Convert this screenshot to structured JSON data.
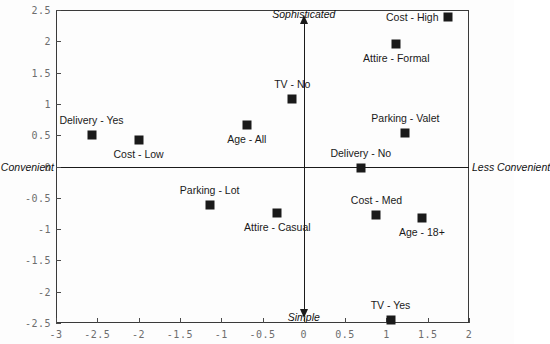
{
  "chart_data": {
    "type": "scatter",
    "title": "",
    "subtitle": "",
    "xlabel": "",
    "ylabel": "",
    "xlim": [
      -3,
      2
    ],
    "ylim": [
      -2.5,
      2.5
    ],
    "grid": false,
    "legend": "none",
    "axis_captions": {
      "top": "Sophisticated",
      "bottom": "Simple",
      "left": "More Convenient",
      "right": "Less Convenient"
    },
    "xticks": [
      -3,
      -2.5,
      -2,
      -1.5,
      -1,
      -0.5,
      0,
      0.5,
      1,
      1.5,
      2
    ],
    "xtick_labels": [
      "-3",
      "-2.5",
      "-2",
      "-1.5",
      "-1",
      "-0.5",
      "0",
      "0.5",
      "1",
      "1.5",
      "2"
    ],
    "yticks": [
      -2.5,
      -2,
      -1.5,
      -1,
      -0.5,
      0,
      0.5,
      1,
      1.5,
      2,
      2.5
    ],
    "ytick_labels": [
      "-2.5",
      "-2",
      "-1.5",
      "-1",
      "-0.5",
      "0",
      "0.5",
      "1",
      "1.5",
      "2",
      "2.5"
    ],
    "marker": {
      "shape": "square",
      "color": "#1a1a1a",
      "size": 9
    },
    "points": [
      {
        "label": "Delivery - Yes",
        "x": -2.57,
        "y": 0.5,
        "label_pos": "above"
      },
      {
        "label": "Cost - Low",
        "x": -2.0,
        "y": 0.42,
        "label_pos": "below"
      },
      {
        "label": "Age - All",
        "x": -0.69,
        "y": 0.66,
        "label_pos": "below"
      },
      {
        "label": "TV - No",
        "x": -0.14,
        "y": 1.08,
        "label_pos": "above"
      },
      {
        "label": "Parking - Lot",
        "x": -1.14,
        "y": -0.62,
        "label_pos": "above"
      },
      {
        "label": "Attire - Casual",
        "x": -0.32,
        "y": -0.74,
        "label_pos": "below"
      },
      {
        "label": "Cost - High",
        "x": 1.74,
        "y": 2.39,
        "label_pos": "left"
      },
      {
        "label": "Attire - Formal",
        "x": 1.12,
        "y": 1.96,
        "label_pos": "below"
      },
      {
        "label": "Parking - Valet",
        "x": 1.23,
        "y": 0.53,
        "label_pos": "above"
      },
      {
        "label": "Delivery - No",
        "x": 0.69,
        "y": -0.02,
        "label_pos": "above"
      },
      {
        "label": "Cost - Med",
        "x": 0.88,
        "y": -0.77,
        "label_pos": "above"
      },
      {
        "label": "Age - 18+",
        "x": 1.43,
        "y": -0.82,
        "label_pos": "below"
      },
      {
        "label": "TV - Yes",
        "x": 1.05,
        "y": -2.45,
        "label_pos": "above"
      }
    ]
  }
}
